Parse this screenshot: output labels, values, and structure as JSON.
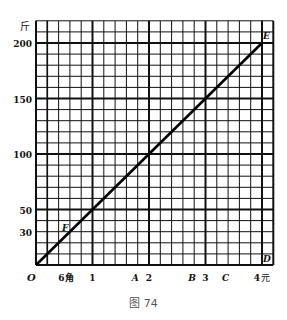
{
  "chart_data": {
    "type": "line",
    "title": "",
    "caption": "图 74",
    "xlabel": "元",
    "ylabel": "斤",
    "xlim": [
      0,
      4.2
    ],
    "ylim": [
      0,
      220
    ],
    "grid": true,
    "grid_minor_x": 0.2,
    "grid_minor_y": 10,
    "x_ticks": [
      {
        "value": 0.6,
        "label": "6角"
      },
      {
        "value": 1,
        "label": "1"
      },
      {
        "value": 2,
        "label": "2"
      },
      {
        "value": 3,
        "label": "3"
      },
      {
        "value": 4,
        "label": "4元"
      }
    ],
    "y_ticks": [
      {
        "value": 30,
        "label": "30"
      },
      {
        "value": 50,
        "label": "50"
      },
      {
        "value": 100,
        "label": "100"
      },
      {
        "value": 150,
        "label": "150"
      },
      {
        "value": 200,
        "label": "200"
      }
    ],
    "origin_label": "O",
    "series": [
      {
        "name": "OE",
        "x": [
          0,
          1,
          2,
          3,
          4
        ],
        "y": [
          0,
          50,
          100,
          150,
          200
        ]
      }
    ],
    "point_labels": [
      {
        "label": "E",
        "x": 4,
        "y": 200
      },
      {
        "label": "F",
        "x": 0.6,
        "y": 30
      },
      {
        "label": "D",
        "x": 4,
        "y": 0
      },
      {
        "label": "A",
        "x": 1.8,
        "y": 0
      },
      {
        "label": "B",
        "x": 2.8,
        "y": 0
      },
      {
        "label": "C",
        "x": 3.4,
        "y": 0
      }
    ]
  }
}
